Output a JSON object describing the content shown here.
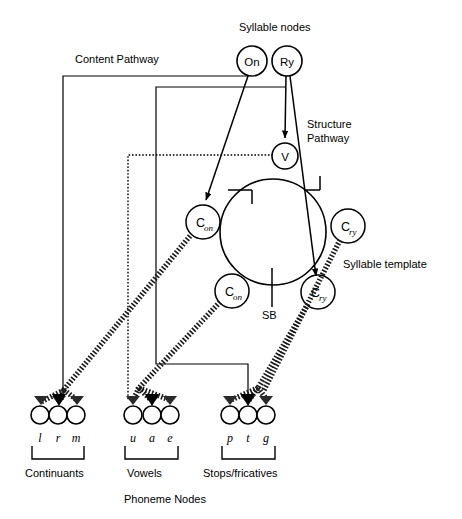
{
  "figure": {
    "background": "#ffffff",
    "ink": "#000000"
  },
  "labels": {
    "syllable_nodes": "Syllable nodes",
    "content_pathway": "Content Pathway",
    "structure_pathway_line1": "Structure",
    "structure_pathway_line2": "Pathway",
    "syllable_template": "Syllable template",
    "syllable_boundary": "SB",
    "phoneme_nodes": "Phoneme Nodes"
  },
  "syllable_nodes": [
    {
      "id": "on",
      "label": "On",
      "cx": 252,
      "cy": 61,
      "r": 15
    },
    {
      "id": "ry",
      "label": "Ry",
      "cx": 287,
      "cy": 61,
      "r": 15
    }
  ],
  "vowel_node": {
    "id": "v",
    "label": "V",
    "cx": 285,
    "cy": 156,
    "r": 13
  },
  "template_circle": {
    "cx": 273,
    "cy": 232,
    "r": 53
  },
  "template_slots": [
    {
      "id": "c-on-upper",
      "label": "C",
      "sub": "on",
      "cx": 203,
      "cy": 222,
      "r": 17
    },
    {
      "id": "c-ry-upper",
      "label": "C",
      "sub": "ry",
      "cx": 348,
      "cy": 226,
      "r": 17
    },
    {
      "id": "c-on-lower",
      "label": "C",
      "sub": "on",
      "cx": 232,
      "cy": 291,
      "r": 17
    },
    {
      "id": "c-ry-lower",
      "label": "C",
      "sub": "ry",
      "cx": 318,
      "cy": 292,
      "r": 17
    }
  ],
  "phoneme_groups": [
    {
      "id": "continuants",
      "group_label": "Continuants",
      "label_x": 57,
      "label_y": 474,
      "bracket": {
        "x1": 32,
        "x2": 84,
        "y": 445,
        "depth": 13
      },
      "nodes": [
        {
          "symbol": "l",
          "cx": 40,
          "cy": 415,
          "r": 9
        },
        {
          "symbol": "r",
          "cx": 58,
          "cy": 415,
          "r": 9
        },
        {
          "symbol": "m",
          "cx": 76,
          "cy": 415,
          "r": 9
        }
      ]
    },
    {
      "id": "vowels",
      "group_label": "Vowels",
      "label_x": 152,
      "label_y": 474,
      "bracket": {
        "x1": 125,
        "x2": 178,
        "y": 445,
        "depth": 13
      },
      "nodes": [
        {
          "symbol": "u",
          "cx": 133,
          "cy": 415,
          "r": 9
        },
        {
          "symbol": "a",
          "cx": 152,
          "cy": 415,
          "r": 9
        },
        {
          "symbol": "e",
          "cx": 170,
          "cy": 415,
          "r": 9
        }
      ]
    },
    {
      "id": "stops-fricatives",
      "group_label": "Stops/fricatives",
      "label_x": 248,
      "label_y": 474,
      "bracket": {
        "x1": 222,
        "x2": 275,
        "y": 445,
        "depth": 13
      },
      "nodes": [
        {
          "symbol": "p",
          "cx": 230,
          "cy": 415,
          "r": 9
        },
        {
          "symbol": "t",
          "cx": 248,
          "cy": 415,
          "r": 9
        },
        {
          "symbol": "g",
          "cx": 266,
          "cy": 415,
          "r": 9
        }
      ]
    }
  ],
  "text_positions": {
    "syllable_nodes": {
      "x": 239,
      "y": 28
    },
    "content_pathway": {
      "x": 75,
      "y": 60
    },
    "structure_pathway": {
      "x": 307,
      "y": 126
    },
    "syllable_template": {
      "x": 343,
      "y": 265
    },
    "sb": {
      "x": 262,
      "y": 316
    },
    "phoneme_nodes": {
      "x": 124,
      "y": 500
    }
  }
}
